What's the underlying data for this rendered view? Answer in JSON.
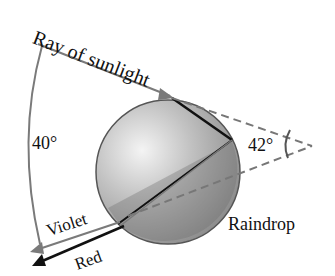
{
  "diagram": {
    "labels": {
      "sunlight": "Ray of sunlight",
      "angle_outer": "40°",
      "angle_inner": "42°",
      "violet": "Violet",
      "red": "Red",
      "raindrop": "Raindrop"
    },
    "colors": {
      "drop_light": "#d8d8d8",
      "drop_dark": "#8e8e8e",
      "violet_ray": "#7a7a7a",
      "red_ray": "#111111",
      "dashed": "#777777"
    }
  }
}
